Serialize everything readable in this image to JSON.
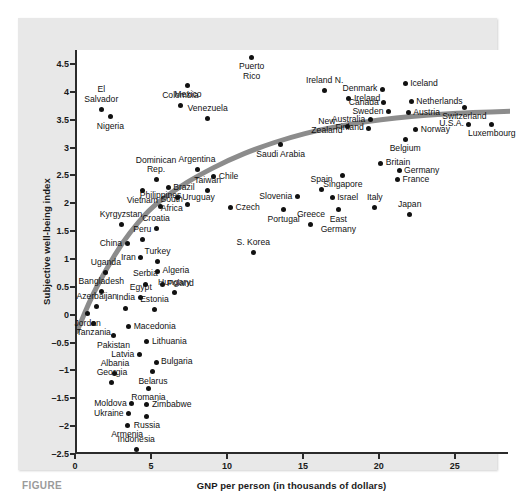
{
  "figure": {
    "caption_label": "FIGURE",
    "panel_background": "#e8e8e8",
    "plot_background": "#ffffff",
    "axis_color": "#2b2b2b",
    "point_color": "#111111",
    "curve_color": "#8c8c8c"
  },
  "chart_data": {
    "type": "scatter",
    "title": "",
    "xlabel": "GNP per person (in thousands of dollars)",
    "ylabel": "Subjective well-being index",
    "xlim": [
      0,
      28.5
    ],
    "ylim": [
      -2.5,
      4.75
    ],
    "xticks": [
      0,
      5,
      10,
      15,
      20,
      25
    ],
    "xtick_labels": [
      "0",
      "5",
      "10",
      "15",
      "20",
      "25"
    ],
    "yticks": [
      -2.5,
      -2,
      -1.5,
      -1,
      -0.5,
      0,
      0.5,
      1,
      1.5,
      2,
      2.5,
      3,
      3.5,
      4,
      4.5
    ],
    "ytick_labels": [
      "-2.5",
      "-2",
      "-1.5",
      "-1",
      "-0.5",
      "0",
      "0.5",
      "1",
      "1.5",
      "2",
      "2.5",
      "3",
      "3.5",
      "4",
      "4.5"
    ],
    "grid": false,
    "legend": "none",
    "annotations": [
      "fitted logarithmic trend curve (thick gray)"
    ],
    "trend_curve": {
      "description": "Thick gray curve rising steeply at low GNP and flattening near y=3.6",
      "points": [
        [
          0.0,
          -0.3
        ],
        [
          1.0,
          0.35
        ],
        [
          2.0,
          0.85
        ],
        [
          3.0,
          1.3
        ],
        [
          4.0,
          1.65
        ],
        [
          5.0,
          1.95
        ],
        [
          6.5,
          2.25
        ],
        [
          8.0,
          2.5
        ],
        [
          10.0,
          2.78
        ],
        [
          12.0,
          3.0
        ],
        [
          14.0,
          3.18
        ],
        [
          16.0,
          3.32
        ],
        [
          18.0,
          3.42
        ],
        [
          20.0,
          3.5
        ],
        [
          22.0,
          3.56
        ],
        [
          24.0,
          3.6
        ],
        [
          26.0,
          3.63
        ],
        [
          28.5,
          3.65
        ]
      ]
    },
    "points": [
      {
        "name": "Puerto Rico",
        "x": 11.5,
        "y": 4.62,
        "label_pos": "below",
        "label_lines": [
          "Puerto",
          "Rico"
        ]
      },
      {
        "name": "Mexico",
        "x": 7.3,
        "y": 4.12,
        "label_pos": "below",
        "label_lines": [
          "Mexico"
        ]
      },
      {
        "name": "El Salvador",
        "x": 1.6,
        "y": 3.68,
        "label_pos": "above",
        "label_lines": [
          "El",
          "Salvador"
        ]
      },
      {
        "name": "Colombia",
        "x": 6.8,
        "y": 3.75,
        "label_pos": "above",
        "label_lines": [
          "Colombia"
        ]
      },
      {
        "name": "Nigeria",
        "x": 2.2,
        "y": 3.55,
        "label_pos": "below",
        "label_lines": [
          "Nigeria"
        ]
      },
      {
        "name": "Venezuela",
        "x": 8.6,
        "y": 3.52,
        "label_pos": "above",
        "label_lines": [
          "Venezuela"
        ]
      },
      {
        "name": "Ireland N.",
        "x": 16.3,
        "y": 4.02,
        "label_pos": "above",
        "label_lines": [
          "Ireland N."
        ]
      },
      {
        "name": "Ireland",
        "x": 17.9,
        "y": 3.88,
        "label_pos": "right",
        "label_lines": [
          "Ireland"
        ]
      },
      {
        "name": "Denmark",
        "x": 20.1,
        "y": 4.05,
        "label_pos": "left",
        "label_lines": [
          "Denmark"
        ]
      },
      {
        "name": "Iceland",
        "x": 21.6,
        "y": 4.15,
        "label_pos": "right",
        "label_lines": [
          "Iceland"
        ]
      },
      {
        "name": "Canada",
        "x": 20.2,
        "y": 3.8,
        "label_pos": "left",
        "label_lines": [
          "Canada"
        ]
      },
      {
        "name": "Netherlands",
        "x": 22.0,
        "y": 3.82,
        "label_pos": "right",
        "label_lines": [
          "Netherlands"
        ]
      },
      {
        "name": "Sweden",
        "x": 20.5,
        "y": 3.64,
        "label_pos": "left",
        "label_lines": [
          "Sweden"
        ]
      },
      {
        "name": "Austria",
        "x": 21.8,
        "y": 3.62,
        "label_pos": "right",
        "label_lines": [
          "Austria"
        ]
      },
      {
        "name": "Australia",
        "x": 19.3,
        "y": 3.5,
        "label_pos": "left",
        "label_lines": [
          "Australia"
        ]
      },
      {
        "name": "Switzerland",
        "x": 25.5,
        "y": 3.72,
        "label_pos": "below",
        "label_lines": [
          "Switzerland"
        ]
      },
      {
        "name": "U.S.A.",
        "x": 25.8,
        "y": 3.42,
        "label_pos": "left",
        "label_lines": [
          "U.S.A."
        ]
      },
      {
        "name": "Luxembourg",
        "x": 27.3,
        "y": 3.42,
        "label_pos": "below",
        "label_lines": [
          "Luxembourg"
        ]
      },
      {
        "name": "Finland",
        "x": 19.2,
        "y": 3.35,
        "label_pos": "left",
        "label_lines": [
          "Finland"
        ]
      },
      {
        "name": "New Zealand",
        "x": 17.8,
        "y": 3.38,
        "label_pos": "left",
        "label_lines": [
          "New",
          "Zealand"
        ]
      },
      {
        "name": "Norway",
        "x": 22.3,
        "y": 3.32,
        "label_pos": "right",
        "label_lines": [
          "Norway"
        ]
      },
      {
        "name": "Belgium",
        "x": 21.6,
        "y": 3.15,
        "label_pos": "below",
        "label_lines": [
          "Belgium"
        ]
      },
      {
        "name": "Saudi Arabia",
        "x": 13.4,
        "y": 3.05,
        "label_pos": "below",
        "label_lines": [
          "Saudi Arabia"
        ]
      },
      {
        "name": "Britain",
        "x": 20.0,
        "y": 2.72,
        "label_pos": "right",
        "label_lines": [
          "Britain"
        ]
      },
      {
        "name": "Germany",
        "x": 21.2,
        "y": 2.58,
        "label_pos": "right",
        "label_lines": [
          "Germany"
        ]
      },
      {
        "name": "France",
        "x": 21.1,
        "y": 2.42,
        "label_pos": "right",
        "label_lines": [
          "France"
        ]
      },
      {
        "name": "Singapore",
        "x": 17.5,
        "y": 2.5,
        "label_pos": "below",
        "label_lines": [
          "Singapore"
        ]
      },
      {
        "name": "Argentina",
        "x": 7.9,
        "y": 2.6,
        "label_pos": "above",
        "label_lines": [
          "Argentina"
        ]
      },
      {
        "name": "Chile",
        "x": 9.0,
        "y": 2.48,
        "label_pos": "right",
        "label_lines": [
          "Chile"
        ]
      },
      {
        "name": "Dominican Rep.",
        "x": 5.2,
        "y": 2.42,
        "label_pos": "above",
        "label_lines": [
          "Dominican",
          "Rep."
        ]
      },
      {
        "name": "Brazil",
        "x": 6.0,
        "y": 2.28,
        "label_pos": "right",
        "label_lines": [
          "Brazil"
        ]
      },
      {
        "name": "Taiwan",
        "x": 8.6,
        "y": 2.22,
        "label_pos": "above",
        "label_lines": [
          "Taiwan"
        ]
      },
      {
        "name": "Vietnam",
        "x": 4.3,
        "y": 2.22,
        "label_pos": "below",
        "label_lines": [
          "Vietnam"
        ]
      },
      {
        "name": "Uruguay",
        "x": 6.6,
        "y": 2.1,
        "label_pos": "right",
        "label_lines": [
          "Uruguay"
        ]
      },
      {
        "name": "Spain",
        "x": 16.1,
        "y": 2.25,
        "label_pos": "above",
        "label_lines": [
          "Spain"
        ]
      },
      {
        "name": "Slovenia",
        "x": 14.5,
        "y": 2.12,
        "label_pos": "left",
        "label_lines": [
          "Slovenia"
        ]
      },
      {
        "name": "Israel",
        "x": 16.8,
        "y": 2.1,
        "label_pos": "right",
        "label_lines": [
          "Israel"
        ]
      },
      {
        "name": "Italy",
        "x": 19.6,
        "y": 1.92,
        "label_pos": "above",
        "label_lines": [
          "Italy"
        ]
      },
      {
        "name": "Japan",
        "x": 21.9,
        "y": 1.8,
        "label_pos": "above",
        "label_lines": [
          "Japan"
        ]
      },
      {
        "name": "Philippines",
        "x": 5.5,
        "y": 1.95,
        "label_pos": "above",
        "label_lines": [
          "Philippines"
        ]
      },
      {
        "name": "South Africa",
        "x": 7.3,
        "y": 1.98,
        "label_pos": "left",
        "label_lines": [
          "South",
          "Africa"
        ]
      },
      {
        "name": "Czech",
        "x": 10.1,
        "y": 1.92,
        "label_pos": "right",
        "label_lines": [
          "Czech"
        ]
      },
      {
        "name": "East Germany",
        "x": 17.2,
        "y": 1.88,
        "label_pos": "below",
        "label_lines": [
          "East",
          "Germany"
        ]
      },
      {
        "name": "Portugal",
        "x": 13.6,
        "y": 1.88,
        "label_pos": "below",
        "label_lines": [
          "Portugal"
        ]
      },
      {
        "name": "Greece",
        "x": 15.4,
        "y": 1.62,
        "label_pos": "above",
        "label_lines": [
          "Greece"
        ]
      },
      {
        "name": "Kyrgyzstan",
        "x": 2.9,
        "y": 1.62,
        "label_pos": "above",
        "label_lines": [
          "Kyrgyzstan"
        ]
      },
      {
        "name": "Croatia",
        "x": 5.2,
        "y": 1.55,
        "label_pos": "above",
        "label_lines": [
          "Croatia"
        ]
      },
      {
        "name": "Peru",
        "x": 4.3,
        "y": 1.35,
        "label_pos": "above",
        "label_lines": [
          "Peru"
        ]
      },
      {
        "name": "China",
        "x": 3.3,
        "y": 1.28,
        "label_pos": "left",
        "label_lines": [
          "China"
        ]
      },
      {
        "name": "S. Korea",
        "x": 11.6,
        "y": 1.12,
        "label_pos": "above",
        "label_lines": [
          "S. Korea"
        ]
      },
      {
        "name": "Iran",
        "x": 4.2,
        "y": 1.02,
        "label_pos": "left",
        "label_lines": [
          "Iran"
        ]
      },
      {
        "name": "Turkey",
        "x": 5.3,
        "y": 0.95,
        "label_pos": "above",
        "label_lines": [
          "Turkey"
        ]
      },
      {
        "name": "Uganda",
        "x": 1.9,
        "y": 0.75,
        "label_pos": "above",
        "label_lines": [
          "Uganda"
        ]
      },
      {
        "name": "Algeria",
        "x": 5.3,
        "y": 0.78,
        "label_pos": "right",
        "label_lines": [
          "Algeria"
        ]
      },
      {
        "name": "Serbia",
        "x": 4.5,
        "y": 0.55,
        "label_pos": "above",
        "label_lines": [
          "Serbia"
        ]
      },
      {
        "name": "Poland",
        "x": 5.6,
        "y": 0.55,
        "label_pos": "right",
        "label_lines": [
          "Poland"
        ]
      },
      {
        "name": "Bangladesh",
        "x": 1.6,
        "y": 0.42,
        "label_pos": "above",
        "label_lines": [
          "Bangladesh"
        ]
      },
      {
        "name": "Hungary",
        "x": 6.4,
        "y": 0.4,
        "label_pos": "above",
        "label_lines": [
          "Hungary"
        ]
      },
      {
        "name": "Egypt",
        "x": 4.2,
        "y": 0.3,
        "label_pos": "above",
        "label_lines": [
          "Egypt"
        ]
      },
      {
        "name": "Azerbaijan",
        "x": 1.3,
        "y": 0.15,
        "label_pos": "above",
        "label_lines": [
          "Azerbaijan"
        ]
      },
      {
        "name": "India",
        "x": 3.2,
        "y": 0.12,
        "label_pos": "above",
        "label_lines": [
          "India"
        ]
      },
      {
        "name": "Estonia",
        "x": 5.1,
        "y": 0.1,
        "label_pos": "above",
        "label_lines": [
          "Estonia"
        ]
      },
      {
        "name": "Jordan",
        "x": 0.7,
        "y": 0.02,
        "label_pos": "below",
        "label_lines": [
          "Jordan"
        ]
      },
      {
        "name": "Tanzania",
        "x": 1.1,
        "y": -0.15,
        "label_pos": "below",
        "label_lines": [
          "Tanzania"
        ]
      },
      {
        "name": "Macedonia",
        "x": 3.4,
        "y": -0.22,
        "label_pos": "right",
        "label_lines": [
          "Macedonia"
        ]
      },
      {
        "name": "Pakistan",
        "x": 2.4,
        "y": -0.38,
        "label_pos": "below",
        "label_lines": [
          "Pakistan"
        ]
      },
      {
        "name": "Lithuania",
        "x": 4.6,
        "y": -0.48,
        "label_pos": "right",
        "label_lines": [
          "Lithuania"
        ]
      },
      {
        "name": "Latvia",
        "x": 4.1,
        "y": -0.72,
        "label_pos": "left",
        "label_lines": [
          "Latvia"
        ]
      },
      {
        "name": "Bulgaria",
        "x": 5.2,
        "y": -0.85,
        "label_pos": "right",
        "label_lines": [
          "Bulgaria"
        ]
      },
      {
        "name": "Albania",
        "x": 2.5,
        "y": -1.05,
        "label_pos": "above",
        "label_lines": [
          "Albania"
        ]
      },
      {
        "name": "Belarus",
        "x": 5.0,
        "y": -1.02,
        "label_pos": "below",
        "label_lines": [
          "Belarus"
        ]
      },
      {
        "name": "Georgia",
        "x": 2.3,
        "y": -1.22,
        "label_pos": "above",
        "label_lines": [
          "Georgia"
        ]
      },
      {
        "name": "Romania",
        "x": 4.7,
        "y": -1.32,
        "label_pos": "below",
        "label_lines": [
          "Romania"
        ]
      },
      {
        "name": "Moldova",
        "x": 3.6,
        "y": -1.6,
        "label_pos": "left",
        "label_lines": [
          "Moldova"
        ]
      },
      {
        "name": "Zimbabwe",
        "x": 4.6,
        "y": -1.62,
        "label_pos": "right",
        "label_lines": [
          "Zimbabwe"
        ]
      },
      {
        "name": "Ukraine",
        "x": 3.4,
        "y": -1.78,
        "label_pos": "left",
        "label_lines": [
          "Ukraine"
        ]
      },
      {
        "name": "Russia",
        "x": 4.6,
        "y": -1.82,
        "label_pos": "below",
        "label_lines": [
          "Russia"
        ]
      },
      {
        "name": "Armenia",
        "x": 3.3,
        "y": -1.98,
        "label_pos": "below",
        "label_lines": [
          "Armenia"
        ]
      },
      {
        "name": "Indonesia",
        "x": 3.9,
        "y": -2.42,
        "label_pos": "above",
        "label_lines": [
          "Indonesia"
        ]
      }
    ]
  }
}
